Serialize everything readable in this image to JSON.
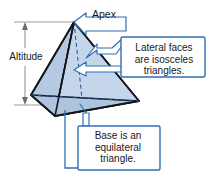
{
  "figure": {
    "type": "geometry-diagram",
    "labels": {
      "apex": "Apex",
      "altitude": "Altitude",
      "lateral_faces": "Lateral faces\nare isosceles\ntriangles.",
      "base": "Base is an\nequilateral\ntriangle."
    },
    "colors": {
      "solid_fill_light": "#c3d4e8",
      "solid_fill_mid": "#b2c7e0",
      "solid_fill_dark": "#a8bfdb",
      "solid_outline": "#12161c",
      "hidden_edge": "#1d4f91",
      "callout_stroke": "#2f6fb5",
      "callout_fill": "#ffffff",
      "dimension_line": "#8a8a8a",
      "text": "#1a1a1a",
      "background": "#ffffff"
    },
    "geometry": {
      "apex": [
        74,
        22
      ],
      "base_front": [
        55,
        116
      ],
      "base_right": [
        139,
        101
      ],
      "base_back_hidden": [
        31,
        95
      ]
    }
  }
}
